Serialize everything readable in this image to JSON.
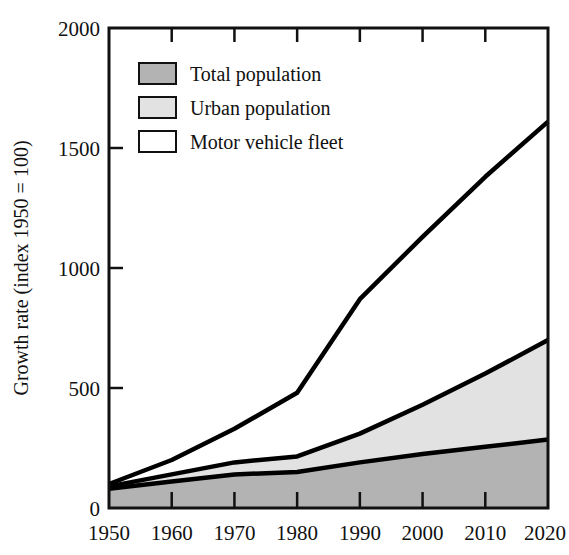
{
  "chart_data": {
    "type": "area",
    "title": "",
    "xlabel": "",
    "ylabel": "Growth rate (index 1950 = 100)",
    "xlim": [
      1950,
      2020
    ],
    "ylim": [
      0,
      2000
    ],
    "grid": false,
    "legend_position": "top-left",
    "stacked": false,
    "x": [
      1950,
      1960,
      1970,
      1980,
      1990,
      2000,
      2010,
      2020
    ],
    "xticks": [
      "1950",
      "1960",
      "1970",
      "1980",
      "1990",
      "2000",
      "2010",
      "2020"
    ],
    "yticks": [
      "0",
      "500",
      "1000",
      "1500",
      "2000"
    ],
    "ytick_values": [
      0,
      500,
      1000,
      1500,
      2000
    ],
    "series": [
      {
        "name": "Motor vehicle fleet",
        "fill": "#ffffff",
        "values": [
          100,
          200,
          330,
          480,
          870,
          1130,
          1380,
          1610
        ]
      },
      {
        "name": "Urban population",
        "fill": "#e2e2e2",
        "values": [
          90,
          140,
          190,
          215,
          310,
          430,
          560,
          700
        ]
      },
      {
        "name": "Total population",
        "fill": "#b3b3b3",
        "values": [
          80,
          110,
          140,
          150,
          190,
          225,
          255,
          285
        ]
      }
    ]
  },
  "legend": {
    "items": [
      {
        "label": "Total population",
        "swatch": "#b3b3b3"
      },
      {
        "label": "Urban population",
        "swatch": "#e2e2e2"
      },
      {
        "label": "Motor vehicle fleet",
        "swatch": "#ffffff"
      }
    ]
  },
  "axes": {
    "y_title": "Growth rate (index 1950 = 100)",
    "y_tick_0": "0",
    "y_tick_1": "500",
    "y_tick_2": "1000",
    "y_tick_3": "1500",
    "y_tick_4": "2000",
    "x_tick_0": "1950",
    "x_tick_1": "1960",
    "x_tick_2": "1970",
    "x_tick_3": "1980",
    "x_tick_4": "1990",
    "x_tick_5": "2000",
    "x_tick_6": "2010",
    "x_tick_7": "2020"
  },
  "colors": {
    "line": "#000000",
    "axis": "#111111",
    "total_population": "#b3b3b3",
    "urban_population": "#e2e2e2",
    "motor_vehicle_fleet": "#ffffff"
  }
}
